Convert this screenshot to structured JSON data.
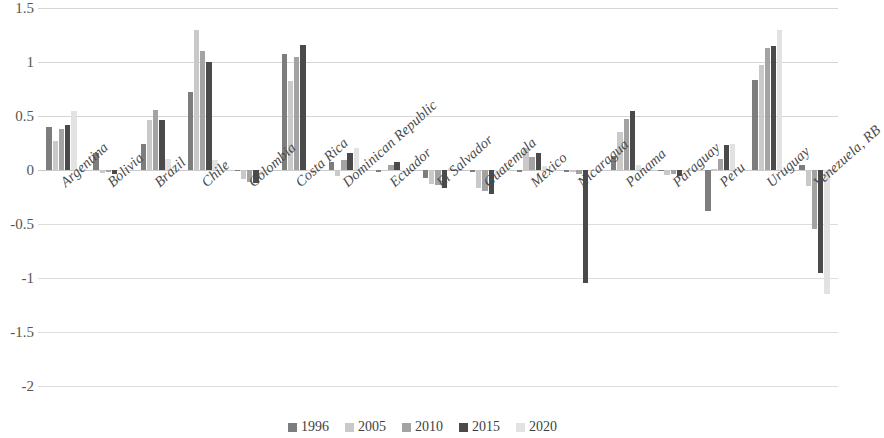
{
  "chart_data": {
    "type": "bar",
    "title": "",
    "subtitle": "",
    "xlabel": "",
    "ylabel": "",
    "ylim": [
      -2,
      1.5
    ],
    "yticks": [
      1.5,
      1,
      0.5,
      0,
      -0.5,
      -1,
      -1.5,
      -2
    ],
    "ytick_labels": [
      "1.5",
      "1",
      "0.5",
      "0",
      "-0.5",
      "-1",
      "-1.5",
      "-2"
    ],
    "grid": true,
    "legend_position": "bottom",
    "categories": [
      "Argentina",
      "Bolivia",
      "Brazil",
      "Chile",
      "Colombia",
      "Costa Rica",
      "Dominican Republic",
      "Ecuador",
      "El Salvador",
      "Guatemala",
      "Mexico",
      "Nicaragua",
      "Panama",
      "Paraguay",
      "Peru",
      "Uruguay",
      "Venezuela, RB"
    ],
    "series": [
      {
        "name": "1996",
        "color": "#7d7d7d",
        "values": [
          0.4,
          0.16,
          0.24,
          0.72,
          0.0,
          1.07,
          0.07,
          -0.02,
          -0.07,
          -0.02,
          -0.02,
          -0.02,
          0.13,
          -0.01,
          -0.38,
          0.83,
          0.05
        ]
      },
      {
        "name": "2005",
        "color": "#c9c9c9",
        "values": [
          0.27,
          -0.03,
          0.46,
          1.3,
          -0.08,
          0.82,
          -0.06,
          0.0,
          -0.13,
          -0.17,
          0.2,
          -0.02,
          0.35,
          -0.05,
          0.01,
          0.97,
          -0.15
        ]
      },
      {
        "name": "2010",
        "color": "#a3a3a3",
        "values": [
          0.38,
          -0.02,
          0.56,
          1.1,
          -0.11,
          1.05,
          0.09,
          0.05,
          -0.14,
          -0.19,
          0.12,
          -0.04,
          0.47,
          -0.04,
          0.1,
          1.13,
          -0.55
        ]
      },
      {
        "name": "2015",
        "color": "#4a4a4a",
        "values": [
          0.42,
          -0.04,
          0.46,
          1.0,
          -0.12,
          1.16,
          0.16,
          0.07,
          -0.17,
          -0.22,
          0.16,
          -1.05,
          0.55,
          -0.06,
          0.23,
          1.15,
          -0.95
        ]
      },
      {
        "name": "2020",
        "color": "#e2e2e2",
        "values": [
          0.55,
          0.0,
          0.1,
          0.09,
          -0.05,
          0.0,
          0.2,
          -0.03,
          0.02,
          -0.05,
          0.04,
          0.0,
          0.05,
          -0.02,
          0.24,
          1.3,
          -1.15
        ]
      }
    ]
  },
  "legend": {
    "items": [
      {
        "label": "1996"
      },
      {
        "label": "2005"
      },
      {
        "label": "2010"
      },
      {
        "label": "2015"
      },
      {
        "label": "2020"
      }
    ]
  }
}
